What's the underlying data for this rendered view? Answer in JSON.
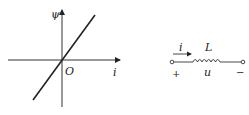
{
  "graph": {
    "y_axis_label": "ψ",
    "x_axis_label": "i",
    "origin_label": "O",
    "line": {
      "from": [
        33,
        100
      ],
      "to": [
        95,
        15
      ],
      "description": "linear flux-current characteristic through origin"
    }
  },
  "circuit": {
    "current_label": "i",
    "inductor_label": "L",
    "voltage_label": "u",
    "plus_sign": "+",
    "minus_sign": "−"
  },
  "colors": {
    "stroke": "#222222"
  }
}
